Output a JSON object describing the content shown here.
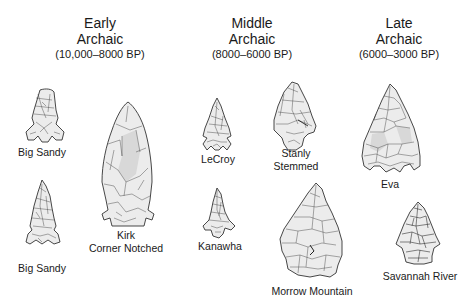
{
  "periods": [
    {
      "line1": "Early",
      "line2": "Archaic",
      "range": "(10,000–8000 BP)"
    },
    {
      "line1": "Middle",
      "line2": "Archaic",
      "range": "(8000–6000 BP)"
    },
    {
      "line1": "Late",
      "line2": "Archaic",
      "range": "(6000–3000 BP)"
    }
  ],
  "points": [
    {
      "period": "Early",
      "label": "Big Sandy"
    },
    {
      "period": "Early",
      "label": "Big Sandy"
    },
    {
      "period": "Early",
      "label_line1": "Kirk",
      "label_line2": "Corner Notched"
    },
    {
      "period": "Middle",
      "label": "LeCroy"
    },
    {
      "period": "Middle",
      "label": "Kanawha"
    },
    {
      "period": "Middle",
      "label_line1": "Stanly",
      "label_line2": "Stemmed"
    },
    {
      "period": "Middle",
      "label": "Morrow Mountain"
    },
    {
      "period": "Late",
      "label": "Eva"
    },
    {
      "period": "Late",
      "label": "Savannah River"
    }
  ]
}
